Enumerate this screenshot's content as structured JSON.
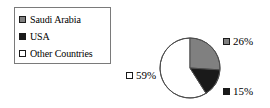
{
  "chart_data": {
    "type": "pie",
    "title": "",
    "categories": [
      "Saudi Arabia",
      "USA",
      "Other Countries"
    ],
    "values": [
      26,
      15,
      59
    ],
    "value_labels": [
      "26%",
      "15%",
      "59%"
    ],
    "colors": [
      "#808080",
      "#1a1a1a",
      "#ffffff"
    ],
    "legend_position": "top-left",
    "start_angle_deg": 0,
    "direction": "clockwise",
    "units": "percent"
  },
  "legend": {
    "items": [
      {
        "label": "Saudi Arabia",
        "swatch": "gray"
      },
      {
        "label": "USA",
        "swatch": "black"
      },
      {
        "label": "Other Countries",
        "swatch": "white"
      }
    ]
  },
  "labels": {
    "saudi": "26%",
    "usa": "15%",
    "other": "59%"
  }
}
